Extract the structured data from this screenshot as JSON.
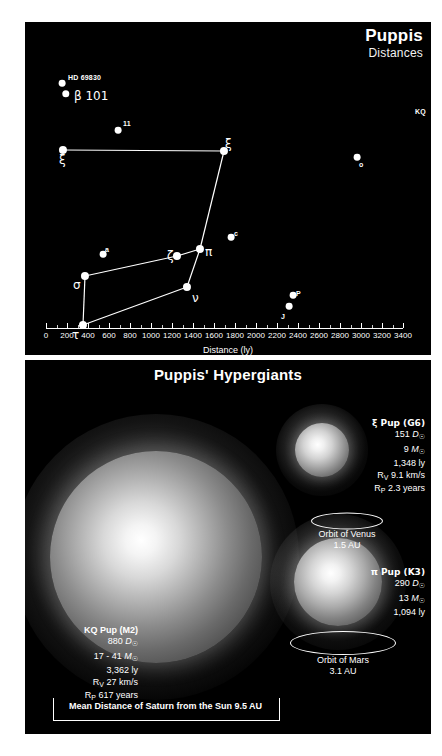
{
  "chart_data": {
    "type": "scatter",
    "title": "Puppis",
    "subtitle": "Distances",
    "xlabel": "Distance (ly)",
    "ylabel": "",
    "xlim": [
      0,
      3400
    ],
    "xticks": [
      0,
      200,
      400,
      600,
      800,
      1000,
      1200,
      1400,
      1600,
      1800,
      2000,
      2200,
      2400,
      2600,
      2800,
      3000,
      3200,
      3400
    ],
    "grid": false,
    "legend": "none",
    "points": [
      {
        "label": "HD 69830",
        "distance_ly": 41,
        "x_px": 37,
        "y_px": 61,
        "label_dx": 6,
        "label_dy": -9,
        "size": 5,
        "style": "tiny"
      },
      {
        "label": "β 101",
        "distance_ly": 81,
        "x_px": 41,
        "y_px": 72,
        "label_dx": 8,
        "label_dy": -4,
        "size": 5.5,
        "style": "greek"
      },
      {
        "label": "11",
        "distance_ly": 406,
        "x_px": 93,
        "y_px": 108,
        "label_dx": 5,
        "label_dy": -10,
        "size": 5,
        "style": "tiny"
      },
      {
        "label": "ξ",
        "distance_ly": 120,
        "x_px": 38,
        "y_px": 128,
        "label_dx": -4,
        "label_dy": 4,
        "size": 6,
        "style": "greek"
      },
      {
        "label": "ξ",
        "distance_ly": 1348,
        "x_px": 199,
        "y_px": 129,
        "label_dx": 1,
        "label_dy": -13,
        "size": 6,
        "style": "greek"
      },
      {
        "label": "o",
        "distance_ly": 2800,
        "x_px": 332,
        "y_px": 135,
        "label_dx": 2,
        "label_dy": 4,
        "size": 5,
        "style": "tiny"
      },
      {
        "label": "KQ",
        "distance_ly": 3362,
        "x_px": 412,
        "y_px": 82,
        "label_dx": -22,
        "label_dy": 4,
        "size": 6,
        "style": "tiny"
      },
      {
        "label": "a",
        "distance_ly": 470,
        "x_px": 78,
        "y_px": 232,
        "label_dx": 2,
        "label_dy": -8,
        "size": 5,
        "style": "tiny"
      },
      {
        "label": "ζ",
        "distance_ly": 1094,
        "x_px": 152,
        "y_px": 234,
        "label_dx": -10,
        "label_dy": -6,
        "size": 6,
        "style": "greek"
      },
      {
        "label": "π",
        "distance_ly": 1094,
        "x_px": 175,
        "y_px": 227,
        "label_dx": 5,
        "label_dy": -3,
        "size": 6,
        "style": "greek"
      },
      {
        "label": "c",
        "distance_ly": 1400,
        "x_px": 206,
        "y_px": 215,
        "label_dx": 3,
        "label_dy": -7,
        "size": 5,
        "style": "tiny"
      },
      {
        "label": "σ",
        "distance_ly": 190,
        "x_px": 60,
        "y_px": 254,
        "label_dx": -12,
        "label_dy": 3,
        "size": 6,
        "style": "greek"
      },
      {
        "label": "ν",
        "distance_ly": 1120,
        "x_px": 162,
        "y_px": 265,
        "label_dx": 5,
        "label_dy": 5,
        "size": 6,
        "style": "greek"
      },
      {
        "label": "P",
        "distance_ly": 2000,
        "x_px": 268,
        "y_px": 273,
        "label_dx": 3,
        "label_dy": -5,
        "size": 5,
        "style": "tiny"
      },
      {
        "label": "J",
        "distance_ly": 1950,
        "x_px": 264,
        "y_px": 284,
        "label_dx": -8,
        "label_dy": 7,
        "size": 5,
        "style": "tiny"
      },
      {
        "label": "τ",
        "distance_ly": 183,
        "x_px": 58,
        "y_px": 303,
        "label_dx": -11,
        "label_dy": 4,
        "size": 6,
        "style": "greek"
      }
    ],
    "connections": [
      [
        3,
        4
      ],
      [
        4,
        9
      ],
      [
        9,
        8
      ],
      [
        8,
        11
      ],
      [
        11,
        15
      ],
      [
        15,
        12
      ],
      [
        12,
        9
      ]
    ]
  },
  "panel_distances": {
    "title": "Puppis",
    "subtitle": "Distances",
    "axis_caption": "Distance (ly)"
  },
  "panel_hypergiants": {
    "title": "Puppis' Hypergiants",
    "stars": [
      {
        "id": "kq-pup",
        "name": "KQ Pup (M2)",
        "diameter": "880",
        "diameter_unit": "D",
        "diameter_sub": "☉",
        "mass": "17 - 41",
        "mass_unit": "M",
        "mass_sub": "☉",
        "distance": "3,362 ly",
        "rv_label": "R",
        "rv_sub": "V",
        "rv_value": "27 km/s",
        "rp_label": "R",
        "rp_sub": "P",
        "rp_value": "617 years"
      },
      {
        "id": "xi-pup",
        "name": "ξ Pup (G6)",
        "diameter": "151",
        "diameter_unit": "D",
        "diameter_sub": "☉",
        "mass": "9",
        "mass_unit": "M",
        "mass_sub": "☉",
        "distance": "1,348 ly",
        "rv_label": "R",
        "rv_sub": "V",
        "rv_value": "9.1 km/s",
        "rp_label": "R",
        "rp_sub": "P",
        "rp_value": "2.3 years"
      },
      {
        "id": "pi-pup",
        "name": "π Pup (K3)",
        "diameter": "290",
        "diameter_unit": "D",
        "diameter_sub": "☉",
        "mass": "13",
        "mass_unit": "M",
        "mass_sub": "☉",
        "distance": "1,094 ly",
        "rv_label": "",
        "rv_sub": "",
        "rv_value": "",
        "rp_label": "",
        "rp_sub": "",
        "rp_value": ""
      }
    ],
    "orbits": [
      {
        "id": "venus-orbit",
        "name": "Orbit of Venus",
        "value": "1.5 AU"
      },
      {
        "id": "mars-orbit",
        "name": "Orbit of Mars",
        "value": "3.1 AU"
      }
    ],
    "scalebar": "Mean Distance of Saturn from the Sun 9.5 AU"
  },
  "colors": {
    "background": "#000000",
    "page": "#ffffff",
    "foreground": "#ffffff",
    "star_glow": "#ffffff"
  }
}
